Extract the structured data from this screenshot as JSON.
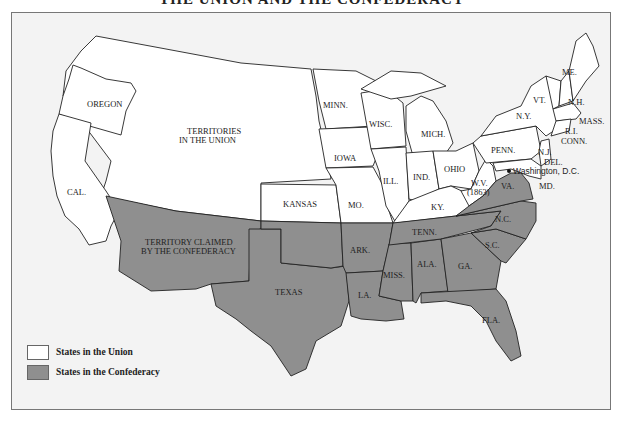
{
  "title": "THE UNION AND THE CONFEDERACY",
  "colors": {
    "union": "#ffffff",
    "confederacy": "#8f8f8f",
    "background": "#f3f3f3",
    "border": "#222222"
  },
  "labels": {
    "oregon": "OREGON",
    "cal": "CAL.",
    "territories_1": "TERRITORIES",
    "territories_2": "IN THE UNION",
    "kansas": "KANSAS",
    "minn": "MINN.",
    "iowa": "IOWA",
    "mo": "MO.",
    "wisc": "WISC.",
    "ill": "ILL.",
    "mich": "MICH.",
    "ind": "IND.",
    "ohio": "OHIO",
    "ky": "KY.",
    "wv_1": "W.V.",
    "wv_2": "(1863)",
    "penn": "PENN.",
    "ny": "N.Y.",
    "vt": "VT.",
    "nh": "N.H.",
    "me": "ME.",
    "mass": "MASS.",
    "ri": "R.I.",
    "conn": "CONN.",
    "nj": "N.J.",
    "del": "DEL.",
    "md": "MD.",
    "dc": "Washington, D.C.",
    "va": "VA.",
    "nc": "N.C.",
    "sc": "S.C.",
    "ga": "GA.",
    "fla": "FLA.",
    "ala": "ALA.",
    "miss": "MISS.",
    "la": "LA.",
    "ark": "ARK.",
    "tenn": "TENN.",
    "texas": "TEXAS",
    "terr_conf_1": "TERRITORY CLAIMED",
    "terr_conf_2": "BY THE CONFEDERACY"
  },
  "legend": {
    "items": [
      {
        "label": "States in the Union",
        "color": "#ffffff"
      },
      {
        "label": "States in the Confederacy",
        "color": "#8f8f8f"
      }
    ]
  }
}
